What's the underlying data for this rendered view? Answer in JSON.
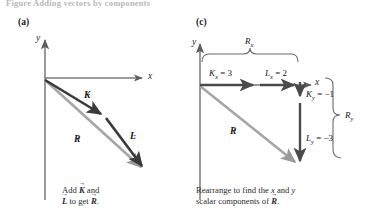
{
  "figure": {
    "top_caption": "Figure  Adding vectors by components",
    "panels": [
      {
        "id": "a",
        "label": "(a)",
        "axis_x_label": "x",
        "axis_y_label": "y",
        "vectors": [
          {
            "name": "K-vector",
            "symbol": "K",
            "color": "#3a3a3a",
            "label_x": 84,
            "label_y": 93
          },
          {
            "name": "L-vector",
            "symbol": "L",
            "color": "#3a3a3a",
            "label_x": 128,
            "label_y": 133
          },
          {
            "name": "R-vector",
            "symbol": "R",
            "color": "#9a9a9a",
            "label_x": 75,
            "label_y": 136
          }
        ],
        "caption_parts": {
          "line1_pre": "Add ",
          "line1_mid": " and",
          "line2_pre": "",
          "line2_mid": " to get ",
          "line2_post": "."
        },
        "caption_symbols": [
          "K",
          "L",
          "R"
        ]
      },
      {
        "id": "c",
        "label": "(c)",
        "axis_x_label": "x",
        "axis_y_label": "y",
        "vectors": [
          {
            "name": "R-vector",
            "symbol": "R",
            "color": "#9a9a9a",
            "label_x": 232,
            "label_y": 128
          }
        ],
        "components": [
          {
            "name": "Kx",
            "base": "K",
            "sub": "x",
            "value": "3",
            "text": "= 3",
            "x": 211,
            "y": 68
          },
          {
            "name": "Lx",
            "base": "L",
            "sub": "x",
            "value": "2",
            "text": "= 2",
            "x": 267,
            "y": 68
          },
          {
            "name": "Ky",
            "base": "K",
            "sub": "y",
            "value": "-1",
            "text": "= −1",
            "x": 312,
            "y": 90
          },
          {
            "name": "Ly",
            "base": "L",
            "sub": "y",
            "value": "-3",
            "text": "= −3",
            "x": 312,
            "y": 134
          }
        ],
        "braces": [
          {
            "name": "Rx-brace",
            "base": "R",
            "sub": "x",
            "x": 248,
            "y": 44
          },
          {
            "name": "Ry-brace",
            "base": "R",
            "sub": "y",
            "x": 348,
            "y": 116
          }
        ],
        "caption_parts": {
          "line1": "Rearrange to find the ",
          "line1_x": "x",
          "line1_and": " and ",
          "line1_y": "y",
          "line2_pre": "scalar components of ",
          "line2_post": "."
        },
        "caption_symbols": [
          "R"
        ]
      }
    ],
    "colors": {
      "axis": "#6d6d6d",
      "vector_dark": "#3a3a3a",
      "vector_gray": "#9a9a9a",
      "component_arrow": "#4a4a4a",
      "brace": "#5a5a5a",
      "text": "#1a1a1a"
    },
    "chart_geometry": {
      "panel_a": {
        "origin": [
          45,
          78
        ],
        "x_axis_end": [
          150,
          78
        ],
        "y_axis_top": [
          45,
          38
        ],
        "y_axis_bottom": [
          45,
          200
        ],
        "K_tip": [
          106,
          117
        ],
        "L_tip": [
          148,
          172
        ],
        "R_tip": [
          147,
          173
        ]
      },
      "panel_c": {
        "origin": [
          200,
          85
        ],
        "x_axis_end": [
          318,
          85
        ],
        "y_axis_top": [
          200,
          42
        ],
        "y_axis_bottom": [
          200,
          200
        ],
        "Kx_end": [
          259,
          85
        ],
        "Lx_end": [
          300,
          85
        ],
        "Ky_end": [
          300,
          102
        ],
        "Ly_end": [
          300,
          167
        ],
        "R_tip": [
          300,
          167
        ]
      }
    }
  }
}
